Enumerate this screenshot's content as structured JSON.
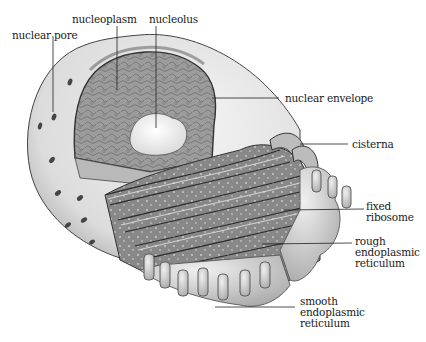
{
  "diagram": {
    "labels": {
      "nuclear_pore": "nuclear pore",
      "nucleoplasm": "nucleoplasm",
      "nucleolus": "nucleolus",
      "nuclear_envelope": "nuclear envelope",
      "cisterna": "cisterna",
      "fixed_ribosome": [
        "fixed",
        "ribosome"
      ],
      "rough_er": [
        "rough",
        "endoplasmic",
        "reticulum"
      ],
      "smooth_er": [
        "smooth",
        "endoplasmic",
        "reticulum"
      ]
    },
    "colors": {
      "background": "#ffffff",
      "nucleus_outer": "#e6e6e6",
      "nucleoplasm": "#9a9a9a",
      "nucleolus": "#f2f2f2",
      "rough_er": "#8a8a8a",
      "smooth_er": "#d8d8d8",
      "line": "#222222"
    }
  }
}
